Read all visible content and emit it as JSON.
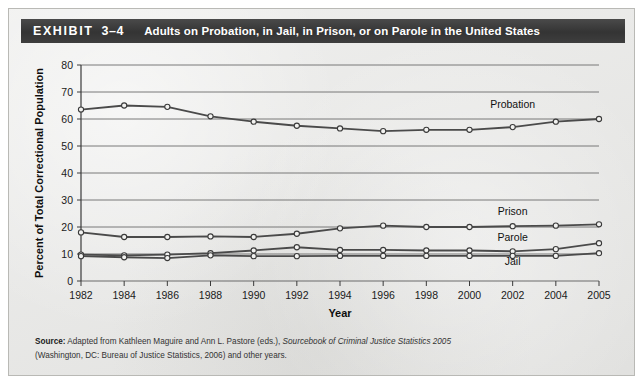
{
  "header": {
    "exhibit_label": "EXHIBIT",
    "exhibit_number": "3–4",
    "title": "Adults on Probation, in Jail, in Prison, or on Parole in the United States",
    "banner_color": "#3c3c3c",
    "text_color": "#ffffff"
  },
  "source": {
    "label": "Source:",
    "line1_a": " Adapted from Kathleen Maguire and Ann L. Pastore (eds.), ",
    "line1_italic": "Sourcebook of Criminal Justice Statistics 2005",
    "line2": "(Washington, DC: Bureau of Justice Statistics, 2006) and other years."
  },
  "chart_data": {
    "type": "line",
    "title": "Adults on Probation, in Jail, in Prison, or on Parole in the United States",
    "xlabel": "Year",
    "ylabel": "Percent of Total Correctional Population",
    "x": [
      1982,
      1984,
      1986,
      1988,
      1990,
      1992,
      1994,
      1996,
      1998,
      2000,
      2002,
      2004,
      2005
    ],
    "xtick_labels": [
      "1982",
      "1984",
      "1986",
      "1988",
      "1990",
      "1992",
      "1994",
      "1996",
      "1998",
      "2000",
      "2002",
      "2004",
      "2005"
    ],
    "ytick_labels": [
      "0",
      "10",
      "20",
      "30",
      "40",
      "50",
      "60",
      "70",
      "80"
    ],
    "yticks": [
      0,
      10,
      20,
      30,
      40,
      50,
      60,
      70,
      80
    ],
    "ylim": [
      0,
      80
    ],
    "xlim": [
      1982,
      2005
    ],
    "grid": "horizontal",
    "legend_position": "inline-right",
    "marker": "open-circle",
    "line_color": "#4a4a4a",
    "marker_fill": "#f2f2f0",
    "series": [
      {
        "name": "Probation",
        "label": "Probation",
        "values": [
          63.5,
          65.0,
          64.5,
          61.0,
          59.0,
          57.5,
          56.5,
          55.5,
          56.0,
          56.0,
          57.0,
          59.0,
          60.0
        ],
        "label_x": 2002,
        "label_y": 64.0
      },
      {
        "name": "Prison",
        "label": "Prison",
        "values": [
          18.0,
          16.3,
          16.3,
          16.5,
          16.3,
          17.5,
          19.5,
          20.5,
          20.0,
          20.0,
          20.3,
          20.5,
          21.0
        ],
        "label_x": 2002,
        "label_y": 24.5
      },
      {
        "name": "Parole",
        "label": "Parole",
        "values": [
          9.8,
          9.5,
          9.8,
          10.3,
          11.3,
          12.5,
          11.5,
          11.5,
          11.3,
          11.3,
          11.0,
          11.8,
          14.0
        ],
        "label_x": 2002,
        "label_y": 14.8
      },
      {
        "name": "Jail",
        "label": "Jail",
        "values": [
          9.2,
          8.8,
          8.5,
          9.5,
          9.2,
          9.2,
          9.3,
          9.3,
          9.3,
          9.3,
          9.3,
          9.3,
          10.3
        ],
        "label_x": 2002,
        "label_y": 6.0
      }
    ]
  }
}
